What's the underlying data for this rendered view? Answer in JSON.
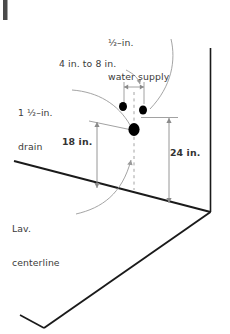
{
  "diagram": {
    "type": "isometric-line-drawing",
    "colors": {
      "wall_line": "#1a1a1a",
      "floor_line": "#1a1a1a",
      "dimension_line": "#8a8a8a",
      "leader_line": "#9a9a9a",
      "centerline": "#9a9a9a",
      "fixture_dot": "#000000",
      "text": "#3a3a3a",
      "background": "#ffffff",
      "corner_artifact": "#4a4a4a"
    },
    "labels": {
      "water_supply": {
        "line1": "½–in.",
        "line2": "water supply"
      },
      "spacing_range": "4 in. to 8 in.",
      "drain": {
        "line1": "1 ½–in.",
        "line2": "drain"
      },
      "height_drain": "18 in.",
      "height_supply": "24 in.",
      "centerline": {
        "line1": "Lav.",
        "line2": "centerline"
      }
    },
    "fixtures": [
      {
        "name": "drain-outlet",
        "label": "1 1/2-in. drain",
        "size": "large"
      },
      {
        "name": "water-supply-left",
        "label": "1/2-in. water supply",
        "size": "small"
      },
      {
        "name": "water-supply-right",
        "label": "1/2-in. water supply",
        "size": "small"
      }
    ],
    "dimensions": [
      {
        "name": "drain-height",
        "value": "18 in.",
        "from": "floor",
        "to": "drain-outlet"
      },
      {
        "name": "supply-height",
        "value": "24 in.",
        "from": "floor",
        "to": "water-supply"
      },
      {
        "name": "supply-spacing",
        "value": "4 in. to 8 in.",
        "between": "water-supply-left and water-supply-right"
      }
    ]
  }
}
